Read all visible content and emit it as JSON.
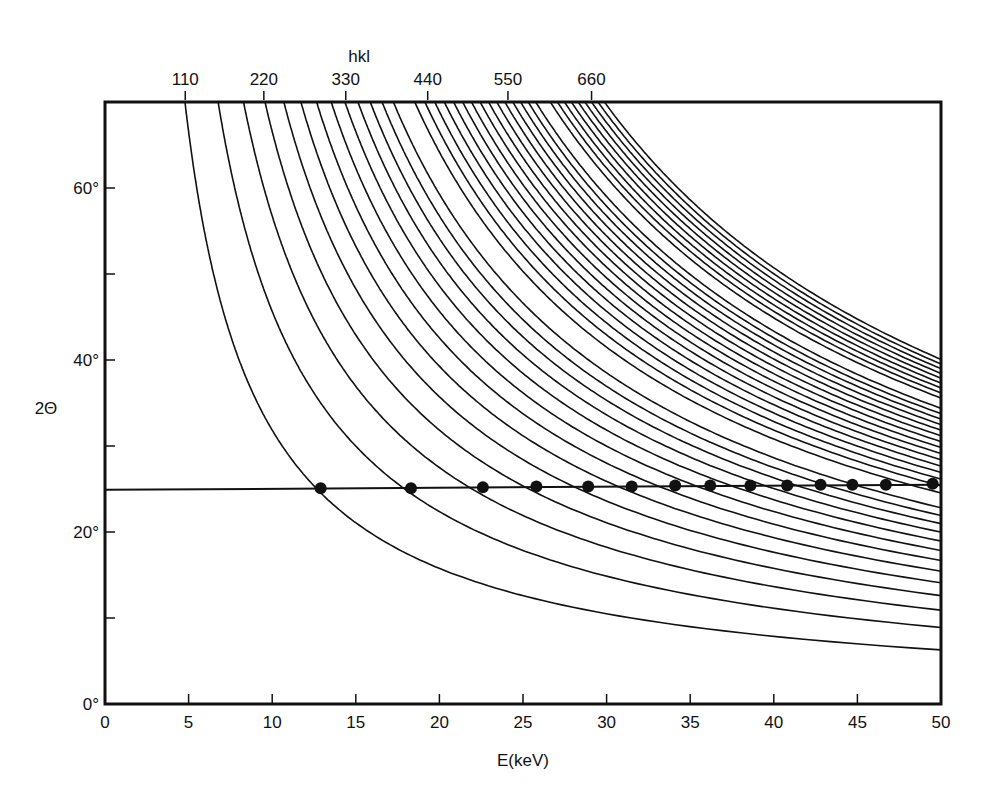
{
  "chart_data": {
    "type": "line",
    "title": "",
    "xlabel": "E(keV)",
    "ylabel": "2Θ",
    "top_axis_label": "hkl",
    "xlim": [
      0,
      50
    ],
    "ylim": [
      0,
      70
    ],
    "x_ticks": [
      0,
      5,
      10,
      15,
      20,
      25,
      30,
      35,
      40,
      45,
      50
    ],
    "x_tick_labels": [
      "0",
      "5",
      "10",
      "15",
      "20",
      "25",
      "30",
      "35",
      "40",
      "45",
      "50"
    ],
    "y_ticks": [
      0,
      10,
      20,
      30,
      40,
      50,
      60
    ],
    "y_tick_labels": [
      {
        "value": 0,
        "label": "0°"
      },
      {
        "value": 20,
        "label": "20°"
      },
      {
        "value": 40,
        "label": "40°"
      },
      {
        "value": 60,
        "label": "60°"
      }
    ],
    "top_ticks": [
      {
        "label": "110",
        "E_at_70deg": 4.8
      },
      {
        "label": "220",
        "E_at_70deg": 9.5
      },
      {
        "label": "330",
        "E_at_70deg": 14.4
      },
      {
        "label": "440",
        "E_at_70deg": 19.3
      },
      {
        "label": "550",
        "E_at_70deg": 24.1
      },
      {
        "label": "660",
        "E_at_70deg": 29.1
      }
    ],
    "grid": false,
    "legend": null,
    "curve_model": "E = K*sqrt(N) / sin(2Θ/2)",
    "curve_constant_K": 1.94,
    "curves_N": [
      2,
      4,
      6,
      8,
      10,
      12,
      14,
      16,
      18,
      20,
      22,
      24,
      26,
      30,
      32,
      34,
      36,
      38,
      40,
      42,
      44,
      46,
      48,
      50,
      52,
      54,
      56,
      58,
      62,
      64,
      66,
      68,
      70,
      72,
      74,
      76,
      78
    ],
    "reference_line": {
      "two_theta_start": 24.9,
      "two_theta_end": 25.5,
      "E_start": 0,
      "E_end": 50
    },
    "marked_points": [
      {
        "E": 12.9,
        "two_theta": 25.1
      },
      {
        "E": 18.3,
        "two_theta": 25.1
      },
      {
        "E": 22.6,
        "two_theta": 25.2
      },
      {
        "E": 25.8,
        "two_theta": 25.3
      },
      {
        "E": 28.9,
        "two_theta": 25.3
      },
      {
        "E": 31.5,
        "two_theta": 25.3
      },
      {
        "E": 34.1,
        "two_theta": 25.4
      },
      {
        "E": 36.2,
        "two_theta": 25.4
      },
      {
        "E": 38.6,
        "two_theta": 25.4
      },
      {
        "E": 40.8,
        "two_theta": 25.4
      },
      {
        "E": 42.8,
        "two_theta": 25.5
      },
      {
        "E": 44.7,
        "two_theta": 25.5
      },
      {
        "E": 46.7,
        "two_theta": 25.5
      },
      {
        "E": 49.5,
        "two_theta": 25.6
      }
    ]
  },
  "layout": {
    "plot_left": 105,
    "plot_right": 941,
    "plot_top": 102,
    "plot_bottom": 704,
    "line_color": "#111111"
  }
}
